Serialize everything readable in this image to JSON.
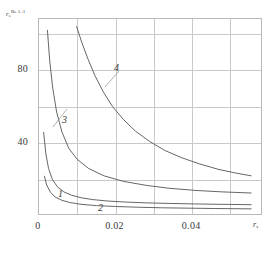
{
  "chart_data": {
    "type": "line",
    "title": "",
    "xlabel": "r_s",
    "ylabel": "r_e^{Re 1..1}",
    "xlim": [
      0,
      0.0585
    ],
    "ylim": [
      0,
      108
    ],
    "grid": true,
    "legend": "inline-curve-labels",
    "xticks": [
      "0",
      "0.02",
      "0.04"
    ],
    "xtick_values": [
      0,
      0.02,
      0.04
    ],
    "yticks": [
      "40",
      "80"
    ],
    "ytick_values": [
      40,
      80
    ],
    "series": [
      {
        "name": "1",
        "label": "1",
        "x": [
          0.0012,
          0.0018,
          0.0025,
          0.0035,
          0.0048,
          0.0065,
          0.0085,
          0.011,
          0.014,
          0.018,
          0.023,
          0.028,
          0.034,
          0.041,
          0.048,
          0.0555
        ],
        "y": [
          46,
          34,
          26,
          20,
          16,
          13.2,
          11.4,
          10.0,
          9.0,
          8.2,
          7.6,
          7.2,
          6.9,
          6.6,
          6.4,
          6.2
        ]
      },
      {
        "name": "2",
        "label": "2",
        "x": [
          0.0014,
          0.002,
          0.003,
          0.0042,
          0.006,
          0.008,
          0.011,
          0.015,
          0.02,
          0.026,
          0.032,
          0.039,
          0.046,
          0.0555
        ],
        "y": [
          22,
          17,
          13,
          10.4,
          8.6,
          7.4,
          6.4,
          5.7,
          5.2,
          4.8,
          4.5,
          4.3,
          4.1,
          3.9
        ]
      },
      {
        "name": "3",
        "label": "3",
        "x": [
          0.0022,
          0.0028,
          0.0036,
          0.0046,
          0.006,
          0.0078,
          0.01,
          0.013,
          0.017,
          0.022,
          0.028,
          0.034,
          0.041,
          0.048,
          0.0555
        ],
        "y": [
          102,
          85,
          70,
          57,
          46,
          37,
          31,
          26,
          22,
          19,
          16.8,
          15.2,
          14.0,
          13.2,
          12.6
        ]
      },
      {
        "name": "4",
        "label": "4",
        "x": [
          0.0098,
          0.0112,
          0.0128,
          0.0146,
          0.0168,
          0.0192,
          0.022,
          0.0252,
          0.0288,
          0.0328,
          0.0372,
          0.042,
          0.047,
          0.0515,
          0.0555
        ],
        "y": [
          104,
          95,
          86,
          77,
          68,
          60,
          53,
          46.5,
          41,
          36,
          32,
          28.5,
          25.5,
          23.5,
          22
        ]
      }
    ],
    "curve_label_positions": [
      {
        "label": "1",
        "x": 58,
        "y": 188
      },
      {
        "label": "2",
        "x": 98,
        "y": 202
      },
      {
        "label": "3",
        "x": 62,
        "y": 114
      },
      {
        "label": "4",
        "x": 114,
        "y": 62
      }
    ]
  },
  "axes": {
    "y_label_main": "r",
    "y_label_sub": "e",
    "y_label_sup": "Re 1..1",
    "x_label_main": "r",
    "x_label_sub": "s"
  },
  "colors": {
    "curve": "#555555",
    "grid": "#c9c9c9",
    "frame": "#b9b9b9",
    "text": "#3a3a3a"
  }
}
